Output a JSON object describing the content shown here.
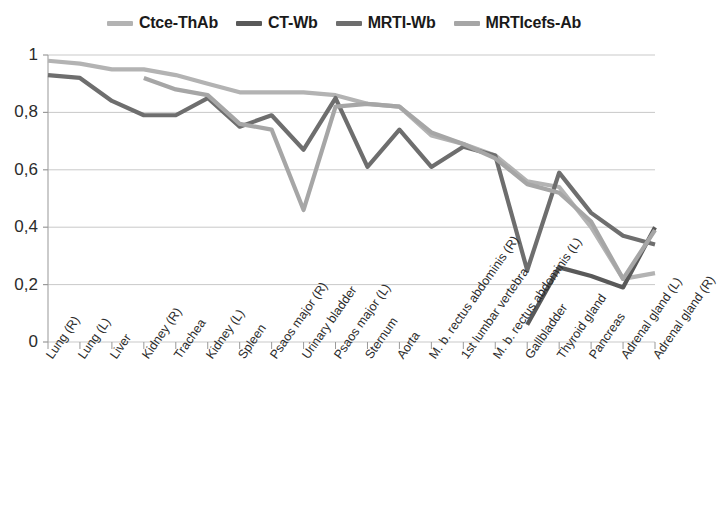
{
  "chart_data": {
    "type": "line",
    "title": "",
    "xlabel": "",
    "ylabel": "",
    "ylim": [
      0,
      1
    ],
    "yticks": [
      "0",
      "0,2",
      "0,4",
      "0,6",
      "0,8",
      "1"
    ],
    "ytick_values": [
      0,
      0.2,
      0.4,
      0.6,
      0.8,
      1
    ],
    "grid": "horizontal",
    "legend_position": "top",
    "categories": [
      "Lung (R)",
      "Lung (L)",
      "Liver",
      "Kidney (R)",
      "Trachea",
      "Kidney (L)",
      "Spleen",
      "Psaos major (R)",
      "Urinary bladder",
      "Psaos major (L)",
      "Sternum",
      "Aorta",
      "M. b. rectus abdominis (R)",
      "1st lumbar vertebra",
      "M. b. rectus abdominis (L)",
      "Gallbladder",
      "Thyroid gland",
      "Pancreas",
      "Adrenal gland (L)",
      "Adrenal gland (R)"
    ],
    "series": [
      {
        "name": "Ctce-ThAb",
        "color": "#b3b3b3",
        "values": [
          0.98,
          0.97,
          0.95,
          0.95,
          0.93,
          0.9,
          0.87,
          0.87,
          0.87,
          0.86,
          0.83,
          0.82,
          0.72,
          0.69,
          0.65,
          0.56,
          0.54,
          0.4,
          0.22,
          0.24
        ]
      },
      {
        "name": "CT-Wb",
        "color": "#595959",
        "values": [
          null,
          null,
          null,
          null,
          null,
          null,
          null,
          null,
          null,
          null,
          null,
          null,
          null,
          null,
          null,
          0.06,
          0.26,
          0.23,
          0.19,
          0.4
        ]
      },
      {
        "name": "MRTI-Wb",
        "color": "#6e6e6e",
        "values": [
          0.93,
          0.92,
          0.84,
          0.79,
          0.79,
          0.85,
          0.75,
          0.79,
          0.67,
          0.85,
          0.61,
          0.74,
          0.61,
          0.68,
          0.65,
          0.25,
          0.59,
          0.45,
          0.37,
          0.34
        ]
      },
      {
        "name": "MRTIcefs-Ab",
        "color": "#a6a6a6",
        "values": [
          null,
          null,
          null,
          0.92,
          0.88,
          0.86,
          0.76,
          0.74,
          0.46,
          0.82,
          0.83,
          0.82,
          0.73,
          0.69,
          0.64,
          0.55,
          0.52,
          0.42,
          0.22,
          0.39
        ]
      }
    ]
  },
  "legend": {
    "items": [
      {
        "label": "Ctce-ThAb",
        "color": "#b3b3b3"
      },
      {
        "label": "CT-Wb",
        "color": "#595959"
      },
      {
        "label": "MRTI-Wb",
        "color": "#6e6e6e"
      },
      {
        "label": "MRTIcefs-Ab",
        "color": "#a6a6a6"
      }
    ]
  },
  "axis": {
    "axis_color": "#a8a8a8",
    "grid_color": "#c9c9c9",
    "tick_color": "#9a9a9a"
  }
}
